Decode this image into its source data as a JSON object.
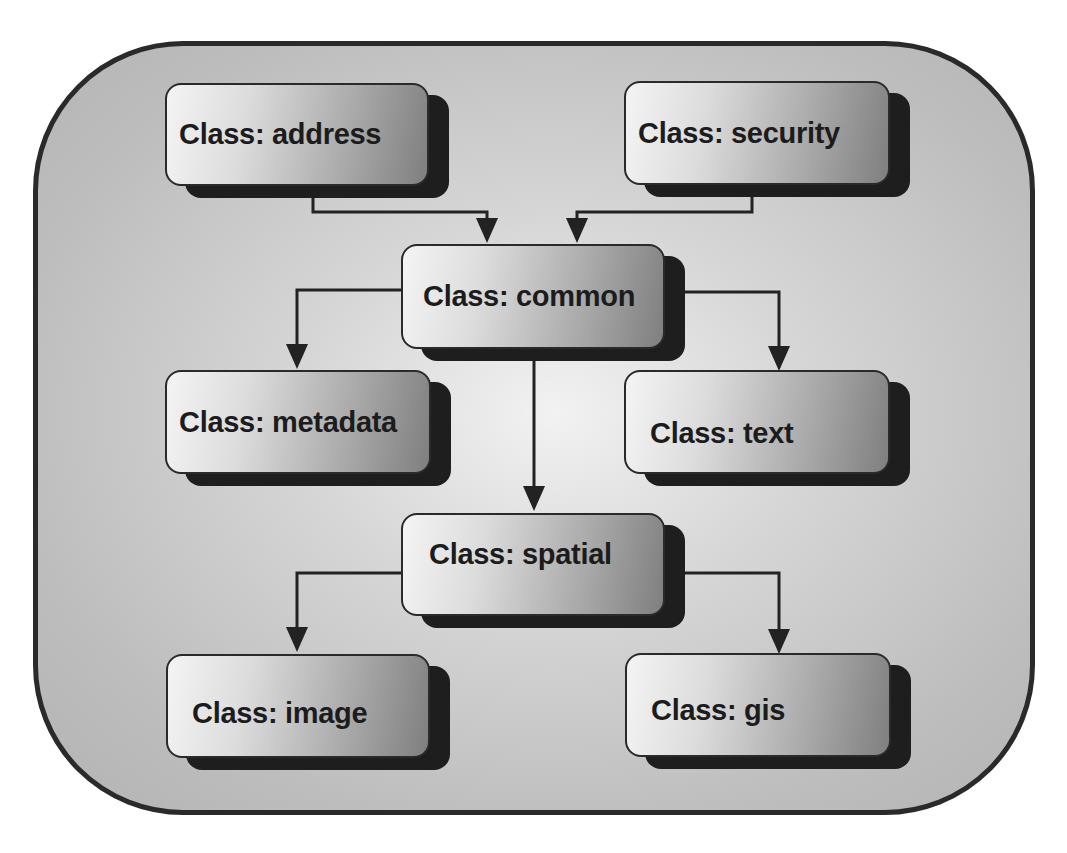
{
  "diagram": {
    "type": "class-hierarchy",
    "colors": {
      "frame_border": "#2a2a2a",
      "shadow": "#1e1e1e",
      "text": "#1c1c1c",
      "arrow": "#222222"
    },
    "nodes": [
      {
        "id": "address",
        "label": "Class: address"
      },
      {
        "id": "security",
        "label": "Class: security"
      },
      {
        "id": "common",
        "label": "Class: common"
      },
      {
        "id": "metadata",
        "label": "Class: metadata"
      },
      {
        "id": "text",
        "label": "Class: text"
      },
      {
        "id": "spatial",
        "label": "Class: spatial"
      },
      {
        "id": "image",
        "label": "Class: image"
      },
      {
        "id": "gis",
        "label": "Class: gis"
      }
    ],
    "edges": [
      {
        "from": "address",
        "to": "common"
      },
      {
        "from": "security",
        "to": "common"
      },
      {
        "from": "common",
        "to": "metadata"
      },
      {
        "from": "common",
        "to": "text"
      },
      {
        "from": "common",
        "to": "spatial"
      },
      {
        "from": "spatial",
        "to": "image"
      },
      {
        "from": "spatial",
        "to": "gis"
      }
    ]
  }
}
